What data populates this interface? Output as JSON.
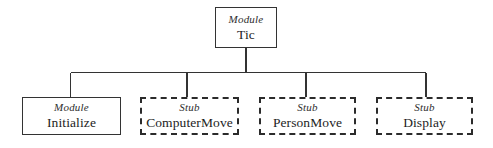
{
  "diagram": {
    "kind": "structure-chart",
    "background_color": "#ffffff",
    "line_color": "#333333",
    "root": {
      "type_label": "Module",
      "name": "Tic",
      "border_style": "solid"
    },
    "children": [
      {
        "type_label": "Module",
        "name": "Initialize",
        "border_style": "solid"
      },
      {
        "type_label": "Stub",
        "name": "ComputerMove",
        "border_style": "dashed"
      },
      {
        "type_label": "Stub",
        "name": "PersonMove",
        "border_style": "dashed"
      },
      {
        "type_label": "Stub",
        "name": "Display",
        "border_style": "dashed"
      }
    ]
  }
}
